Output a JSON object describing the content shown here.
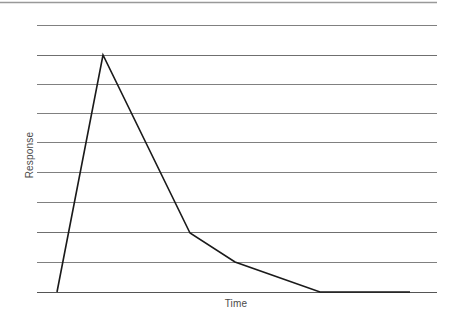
{
  "figure": {
    "width": 458,
    "height": 324,
    "background": "#ffffff"
  },
  "axes": {
    "ylabel": "Response",
    "xlabel": "Time",
    "label_color": "#4a4a4a"
  },
  "style": {
    "gridline_color": "#808080",
    "baseline_color": "#555555",
    "series_color": "#1a1a1a",
    "gridline_width": 1,
    "series_width": 1.6
  },
  "chart_data": {
    "type": "line",
    "title": "",
    "xlabel": "Time",
    "ylabel": "Response",
    "grid": true,
    "grid_axis": "y",
    "legend": false,
    "xlim": [
      0,
      10
    ],
    "ylim": [
      0,
      10
    ],
    "axis_ticks_shown": false,
    "gridline_count": 11,
    "gridline_y_values": [
      10,
      9,
      8,
      7,
      6,
      5,
      4,
      3,
      2,
      1,
      0
    ],
    "series": [
      {
        "name": "Response",
        "x": [
          0.53,
          1.2,
          2.47,
          3.12,
          4.35,
          5.66
        ],
        "y": [
          0,
          8.0,
          2.0,
          1.0,
          0,
          0
        ],
        "points_pixel": [
          [
            57,
            292
          ],
          [
            103,
            55
          ],
          [
            190,
            233
          ],
          [
            235,
            262
          ],
          [
            320,
            292
          ],
          [
            410,
            292
          ]
        ]
      }
    ]
  }
}
